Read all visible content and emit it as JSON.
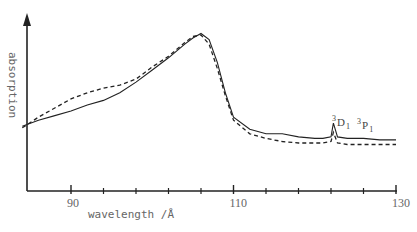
{
  "chart_data": {
    "type": "line",
    "title": "",
    "xlabel": "wavelength /Å",
    "ylabel": "absorption",
    "xlim": [
      84,
      130
    ],
    "xticks": [
      90,
      110,
      130
    ],
    "xticks_minor": [
      94,
      98,
      102,
      106,
      114,
      118,
      122,
      126
    ],
    "grid": false,
    "legend": null,
    "annotations": [
      {
        "label": "3D1",
        "sup": "3",
        "main": "D",
        "sub": "1",
        "x": 122.3
      },
      {
        "label": "3P1",
        "sup": "3",
        "main": "P",
        "sub": "1",
        "x": 126.0
      }
    ],
    "series": [
      {
        "name": "solid (measured)",
        "style": "solid",
        "x": [
          84,
          86,
          88,
          90,
          92,
          94,
          96,
          98,
          100,
          102,
          104,
          105,
          106,
          107,
          108,
          109,
          110,
          112,
          114,
          116,
          118,
          120,
          121,
          122,
          122.3,
          122.8,
          124,
          126,
          128,
          130
        ],
        "y": [
          0.36,
          0.4,
          0.43,
          0.46,
          0.5,
          0.53,
          0.58,
          0.65,
          0.73,
          0.81,
          0.9,
          0.94,
          0.97,
          0.93,
          0.78,
          0.58,
          0.42,
          0.34,
          0.31,
          0.31,
          0.29,
          0.28,
          0.28,
          0.29,
          0.38,
          0.29,
          0.28,
          0.28,
          0.27,
          0.27
        ]
      },
      {
        "name": "dashed (calculated)",
        "style": "dashed",
        "x": [
          84,
          86,
          88,
          90,
          92,
          94,
          96,
          98,
          100,
          102,
          104,
          105,
          106,
          107,
          108,
          109,
          110,
          112,
          114,
          116,
          118,
          120,
          121,
          122,
          122.3,
          122.8,
          124,
          126,
          128,
          130
        ],
        "y": [
          0.35,
          0.42,
          0.48,
          0.54,
          0.58,
          0.61,
          0.63,
          0.67,
          0.75,
          0.82,
          0.91,
          0.95,
          0.96,
          0.9,
          0.74,
          0.56,
          0.4,
          0.31,
          0.28,
          0.26,
          0.25,
          0.25,
          0.25,
          0.26,
          0.32,
          0.25,
          0.24,
          0.24,
          0.24,
          0.24
        ]
      }
    ]
  }
}
